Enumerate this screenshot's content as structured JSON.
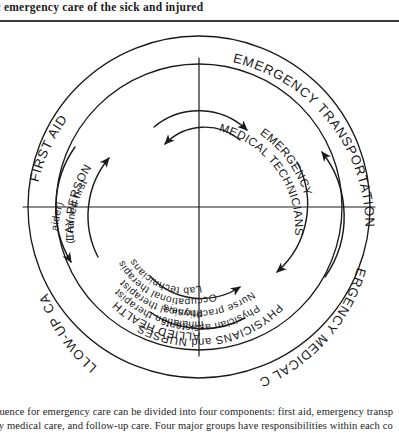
{
  "page": {
    "running_head": "ic emergency care of the sick and injured"
  },
  "figure": {
    "outer_ring": [
      {
        "id": "first-aid",
        "label": "FIRST AID"
      },
      {
        "id": "emergency-transportation",
        "label": "EMERGENCY TRANSPORTATION"
      },
      {
        "id": "emergency-medical-care",
        "label": "EMERGENCY MEDICAL CARE"
      },
      {
        "id": "follow-up-care",
        "label": "FOLLOW-UP CARE"
      }
    ],
    "inner_ring": [
      {
        "id": "lay-person",
        "heading": "LAY PERSON",
        "lines": [
          "(Trained first",
          "aider)"
        ]
      },
      {
        "id": "emergency-medical-technicians",
        "heading": "EMERGENCY",
        "lines": [
          "MEDICAL TECHNICIANS"
        ]
      },
      {
        "id": "physicians-and-nurses",
        "heading": "PHYSICIANS and NURSES",
        "lines": [
          "Physician assistants",
          "Nurse practitioners"
        ]
      },
      {
        "id": "allied-health",
        "heading": "ALLIED HEALTH",
        "lines": [
          "Inhalation therapist",
          "Physical therapist",
          "Occupational therapist",
          "Lab technicians"
        ]
      }
    ],
    "colors": {
      "ink": "#1a1a1a",
      "paper": "#ffffff"
    }
  },
  "caption": {
    "line1": "quence for emergency care can be divided into four components: first aid, emergency transp",
    "line2": "cy medical care, and follow-up care. Four major groups have responsibilities within each co"
  }
}
